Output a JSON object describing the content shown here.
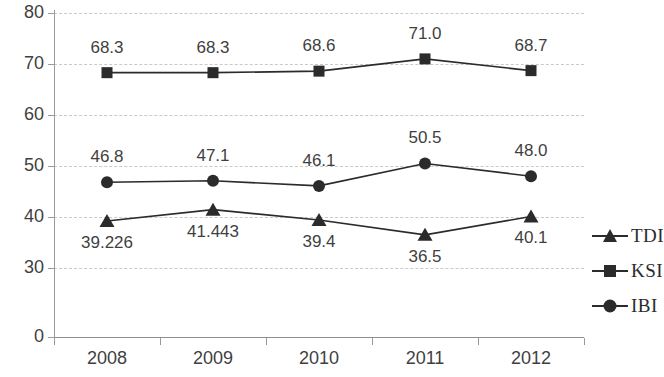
{
  "chart_data": {
    "type": "line",
    "title": "",
    "xlabel": "",
    "ylabel": "",
    "categories": [
      "2008",
      "2009",
      "2010",
      "2011",
      "2012"
    ],
    "ytick_labels": [
      "80",
      "70",
      "60",
      "50",
      "40",
      "30",
      "0"
    ],
    "ytick_values": [
      80,
      70,
      60,
      50,
      40,
      30,
      0
    ],
    "ylim": [
      0,
      80
    ],
    "grid": true,
    "grid_style": "dashed",
    "legend_position": "right",
    "axis_note": "y-axis is broken between 30 and 0 (non-linear gap)",
    "series": [
      {
        "name": "TDI",
        "marker": "triangle",
        "color": "#2b2b2b",
        "values": [
          39.226,
          41.443,
          39.4,
          36.5,
          40.1
        ],
        "labels": [
          "39.226",
          "41.443",
          "39.4",
          "36.5",
          "40.1"
        ],
        "label_position": [
          "below",
          "below",
          "below",
          "below",
          "below"
        ]
      },
      {
        "name": "KSI",
        "marker": "square",
        "color": "#2b2b2b",
        "values": [
          68.3,
          68.3,
          68.6,
          71.0,
          68.7
        ],
        "labels": [
          "68.3",
          "68.3",
          "68.6",
          "71.0",
          "68.7"
        ],
        "label_position": [
          "above",
          "above",
          "above",
          "above",
          "above"
        ]
      },
      {
        "name": "IBI",
        "marker": "circle",
        "color": "#2b2b2b",
        "values": [
          46.8,
          47.1,
          46.1,
          50.5,
          48.0
        ],
        "labels": [
          "46.8",
          "47.1",
          "46.1",
          "50.5",
          "48.0"
        ],
        "label_position": [
          "above",
          "above",
          "above",
          "above",
          "above"
        ]
      }
    ]
  },
  "legend": {
    "items": [
      {
        "label": "TDI",
        "marker": "triangle"
      },
      {
        "label": "KSI",
        "marker": "square"
      },
      {
        "label": "IBI",
        "marker": "circle"
      }
    ]
  }
}
